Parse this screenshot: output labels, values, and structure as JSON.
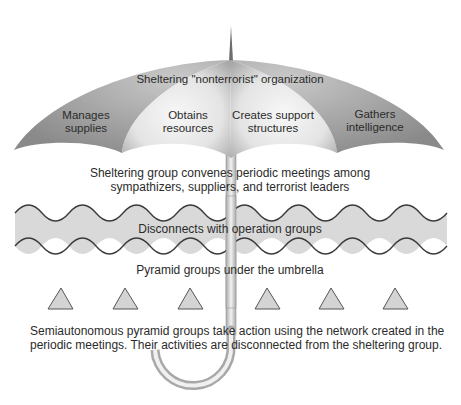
{
  "diagram": {
    "canopy": {
      "title": "Sheltering \"nonterrorist\" organization",
      "panels": [
        {
          "line1": "Manages",
          "line2": "supplies"
        },
        {
          "line1": "Obtains",
          "line2": "resources"
        },
        {
          "line1": "Creates support",
          "line2": "structures"
        },
        {
          "line1": "Gathers",
          "line2": "intelligence"
        }
      ]
    },
    "meetings": {
      "line1": "Sheltering group convenes periodic meetings among",
      "line2": "sympathizers, suppliers, and terrorist leaders"
    },
    "band": {
      "label": "Disconnects with operation groups"
    },
    "pyramids": {
      "label": "Pyramid groups under the umbrella",
      "count": 6
    },
    "footer": {
      "line1": "Semiautonomous pyramid groups take action using the network created in the",
      "line2": "periodic meetings. Their activities are disconnected from the sheltering group."
    },
    "colors": {
      "canopy_dark": "#8e8e8e",
      "canopy_light": "#f2f2f2",
      "band_fill": "#d9d9d9",
      "band_stroke": "#3a3a3a",
      "triangle_fill": "#d4d4d4",
      "triangle_stroke": "#555555",
      "shaft": "#c4c4c4"
    }
  }
}
